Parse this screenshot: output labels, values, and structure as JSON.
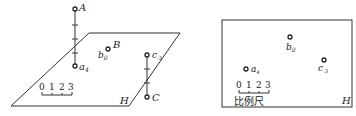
{
  "left_panel": {
    "plane_label": "H",
    "points": {
      "A": {
        "label": "A"
      },
      "a4": {
        "label": "a",
        "sub": "4"
      },
      "B": {
        "label": "B"
      },
      "b0": {
        "label": "b",
        "sub": "0"
      },
      "c_3": {
        "label": "c",
        "sub": "-3"
      },
      "C": {
        "label": "C"
      }
    },
    "scale": {
      "ticks": [
        "0",
        "1",
        "2",
        "3"
      ]
    }
  },
  "right_panel": {
    "plane_label": "H",
    "points": {
      "a4": {
        "label": "a",
        "sub": "4"
      },
      "b0": {
        "label": "b",
        "sub": "0"
      },
      "c_3": {
        "label": "c",
        "sub": "-3"
      }
    },
    "scale": {
      "ticks": [
        "0",
        "1",
        "2",
        "3"
      ],
      "caption": "比例尺"
    }
  },
  "colors": {
    "line": "#333333",
    "text": "#222222",
    "background": "#ffffff"
  }
}
